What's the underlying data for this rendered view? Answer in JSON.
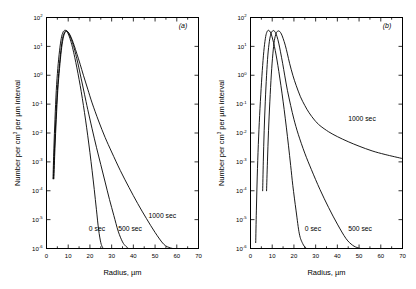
{
  "figure": {
    "panels": [
      {
        "id": "a",
        "label": "(a)",
        "xlabel": "Radius, µm",
        "ylabel_parts": {
          "pre": "Number per cm",
          "sup": "3",
          "post": " per µm interval"
        },
        "ylabel": "Number per cm3 per µm interval"
      },
      {
        "id": "b",
        "label": "(b)",
        "xlabel": "Radius, µm",
        "ylabel_parts": {
          "pre": "Number per cm",
          "sup": "3",
          "post": " per µm interval"
        },
        "ylabel": "Number per cm3 per µm interval"
      }
    ],
    "xticklabels": [
      "0",
      "10",
      "20",
      "30",
      "40",
      "50",
      "60",
      "70"
    ],
    "yticklabels": [
      "-6",
      "-5",
      "-4",
      "-3",
      "-2",
      "-1",
      "0",
      "1",
      "2"
    ],
    "ymantissa": "10"
  },
  "chart_data": [
    {
      "type": "line",
      "panel": "(a)",
      "title": "(a)",
      "xlabel": "Radius, µm",
      "ylabel": "Number per cm3 per µm interval",
      "xlim": [
        0,
        70
      ],
      "ylim": [
        1e-06,
        100
      ],
      "yscale": "log",
      "xticks": [
        0,
        10,
        20,
        30,
        40,
        50,
        60,
        70
      ],
      "yticks": [
        1e-06,
        1e-05,
        0.0001,
        0.001,
        0.01,
        0.1,
        1,
        10,
        100
      ],
      "grid": false,
      "legend": "inline-annotations",
      "annotations": [
        {
          "text": "0 sec",
          "x": 19.5,
          "y": 4e-06
        },
        {
          "text": "500 sec",
          "x": 33.0,
          "y": 4e-06
        },
        {
          "text": "1000 sec",
          "x": 47.0,
          "y": 1.1e-05
        }
      ],
      "series": [
        {
          "name": "0 sec",
          "x": [
            3.0,
            3.4,
            3.9,
            4.5,
            5.2,
            6.0,
            6.8,
            7.6,
            8.4,
            9.0,
            9.6,
            10.4,
            11.2,
            12.0,
            13.0,
            14.0,
            15.0,
            16.0,
            17.0,
            18.0,
            19.0,
            20.0,
            21.0,
            22.0,
            23.0,
            24.0,
            25.0,
            25.8,
            26.2
          ],
          "y": [
            0.00026,
            0.003,
            0.03,
            0.3,
            1.7,
            7.0,
            19.0,
            31.0,
            36.0,
            35.0,
            31.0,
            23.0,
            15.0,
            9.0,
            4.2,
            1.8,
            0.72,
            0.27,
            0.09,
            0.028,
            0.008,
            0.0021,
            0.0005,
            0.00011,
            2.2e-05,
            4.5e-06,
            1.6e-06,
            1.1e-06,
            1e-06
          ]
        },
        {
          "name": "500 sec",
          "x": [
            3.2,
            3.7,
            4.3,
            5.0,
            5.8,
            6.6,
            7.4,
            8.2,
            9.0,
            9.8,
            10.6,
            11.5,
            12.5,
            13.5,
            14.5,
            16.0,
            17.5,
            19.0,
            21.0,
            23.0,
            25.0,
            27.0,
            29.0,
            31.0,
            33.0,
            35.0,
            36.5,
            37.8
          ],
          "y": [
            0.00026,
            0.003,
            0.03,
            0.3,
            1.7,
            7.0,
            19.0,
            30.0,
            35.0,
            32.0,
            25.0,
            17.0,
            10.0,
            5.2,
            2.5,
            0.75,
            0.22,
            0.065,
            0.014,
            0.0032,
            0.0008,
            0.0002,
            5e-05,
            1.4e-05,
            4e-06,
            1.7e-06,
            1.2e-06,
            1e-06
          ]
        },
        {
          "name": "1000 sec",
          "x": [
            3.4,
            3.9,
            4.5,
            5.2,
            6.0,
            6.8,
            7.6,
            8.4,
            9.2,
            10.0,
            10.8,
            11.8,
            12.8,
            14.0,
            15.5,
            17.0,
            19.0,
            21.0,
            24.0,
            27.0,
            30.0,
            34.0,
            38.0,
            42.0,
            46.0,
            50.0,
            54.0,
            57.0,
            58.5
          ],
          "y": [
            0.00026,
            0.003,
            0.03,
            0.3,
            1.7,
            7.0,
            18.0,
            29.0,
            34.0,
            31.0,
            25.0,
            17.0,
            10.5,
            5.5,
            2.4,
            1.0,
            0.33,
            0.11,
            0.026,
            0.007,
            0.0022,
            0.0005,
            0.00013,
            3.6e-05,
            1.1e-05,
            3.6e-06,
            1.4e-06,
            1.05e-06,
            1e-06
          ]
        }
      ]
    },
    {
      "type": "line",
      "panel": "(b)",
      "title": "(b)",
      "xlabel": "Radius, µm",
      "ylabel": "Number per cm3 per µm interval",
      "xlim": [
        0,
        70
      ],
      "ylim": [
        1e-06,
        100
      ],
      "yscale": "log",
      "xticks": [
        0,
        10,
        20,
        30,
        40,
        50,
        60,
        70
      ],
      "yticks": [
        1e-06,
        1e-05,
        0.0001,
        0.001,
        0.01,
        0.1,
        1,
        10,
        100
      ],
      "grid": false,
      "legend": "inline-annotations",
      "annotations": [
        {
          "text": "0 sec",
          "x": 25.0,
          "y": 4e-06
        },
        {
          "text": "500 sec",
          "x": 45.0,
          "y": 4e-06
        },
        {
          "text": "1000 sec",
          "x": 45.0,
          "y": 0.026
        }
      ],
      "series": [
        {
          "name": "0 sec",
          "x": [
            2.4,
            2.7,
            3.1,
            3.6,
            4.2,
            4.9,
            5.6,
            6.3,
            7.0,
            7.6,
            8.2,
            8.8,
            9.5,
            10.2,
            11.0,
            11.8,
            12.6,
            13.5,
            14.5,
            15.5,
            16.5,
            17.5,
            18.5,
            19.5,
            21.0,
            22.5,
            24.0,
            25.4,
            26.2
          ],
          "y": [
            1.6e-06,
            2e-05,
            0.0003,
            0.004,
            0.04,
            0.35,
            2.2,
            9.0,
            22.0,
            32.0,
            36.0,
            34.0,
            27.0,
            18.0,
            10.0,
            5.0,
            2.2,
            0.8,
            0.24,
            0.065,
            0.016,
            0.0036,
            0.00075,
            0.00015,
            2e-05,
            3.2e-06,
            1.5e-06,
            1.05e-06,
            1e-06
          ]
        },
        {
          "name": "500 sec",
          "x": [
            5.6,
            5.9,
            6.3,
            6.8,
            7.4,
            8.0,
            8.7,
            9.4,
            10.1,
            10.8,
            11.5,
            12.2,
            13.0,
            13.8,
            14.8,
            15.8,
            17.0,
            18.5,
            20.0,
            22.0,
            25.0,
            28.0,
            32.0,
            36.0,
            40.0,
            44.0,
            47.0,
            49.5,
            50.8
          ],
          "y": [
            0.0001,
            0.001,
            0.012,
            0.12,
            1.0,
            5.0,
            15.0,
            27.0,
            34.0,
            35.0,
            30.0,
            22.0,
            13.0,
            6.5,
            2.6,
            0.95,
            0.3,
            0.09,
            0.03,
            0.009,
            0.002,
            0.00055,
            0.00011,
            2.6e-05,
            7e-06,
            2.2e-06,
            1.3e-06,
            1.05e-06,
            1e-06
          ]
        },
        {
          "name": "1000 sec",
          "x": [
            7.4,
            7.8,
            8.3,
            8.9,
            9.6,
            10.3,
            11.0,
            11.8,
            12.6,
            13.4,
            14.2,
            15.0,
            16.0,
            17.0,
            18.0,
            19.5,
            21.0,
            23.0,
            25.0,
            27.0,
            29.5,
            32.0,
            36.0,
            40.0,
            45.0,
            50.0,
            56.0,
            62.0,
            70.0
          ],
          "y": [
            0.0001,
            0.001,
            0.012,
            0.12,
            1.1,
            5.5,
            16.0,
            28.0,
            34.0,
            33.0,
            27.0,
            19.0,
            11.0,
            5.5,
            2.6,
            1.0,
            0.45,
            0.18,
            0.09,
            0.05,
            0.028,
            0.018,
            0.011,
            0.0075,
            0.005,
            0.0035,
            0.0024,
            0.0018,
            0.0013
          ]
        }
      ]
    }
  ]
}
